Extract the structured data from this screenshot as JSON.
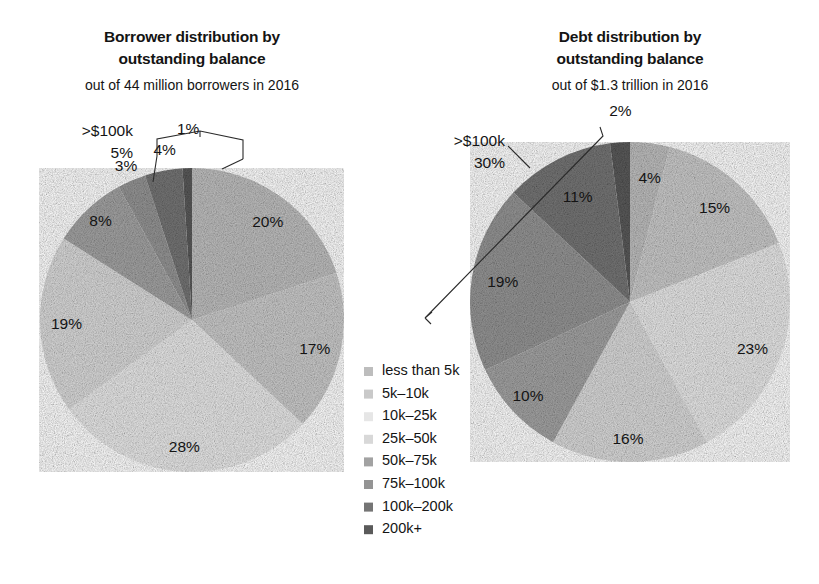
{
  "chart_data": [
    {
      "type": "pie",
      "id": "borrower-distribution",
      "title": "Borrower distribution by outstanding balance",
      "title_line1": "Borrower distribution by",
      "title_line2": "outstanding balance",
      "subtitle": "out of  44 million borrowers in 2016",
      "categories": [
        "less than 5k",
        "5k–10k",
        "10k–25k",
        "25k–50k",
        "50k–75k",
        "75k–100k",
        "100k–200k",
        "200k+"
      ],
      "values": [
        20,
        17,
        28,
        19,
        8,
        3,
        4,
        1
      ],
      "value_labels": [
        "20%",
        "17%",
        "28%",
        "19%",
        "8%",
        "3%",
        "4%",
        "1%"
      ],
      "annotation": {
        "line1": ">$100k",
        "line2": "5%"
      },
      "legend_position": "center-right (shared)",
      "grid": false
    },
    {
      "type": "pie",
      "id": "debt-distribution",
      "title": "Debt distribution by outstanding balance",
      "title_line1": "Debt distribution by",
      "title_line2": "outstanding balance",
      "subtitle": "out of $1.3 trillion in 2016",
      "categories": [
        "less than 5k",
        "5k–10k",
        "10k–25k",
        "25k–50k",
        "50k–75k",
        "75k–100k",
        "100k–200k",
        "200k+"
      ],
      "values": [
        4,
        15,
        23,
        16,
        10,
        19,
        11,
        2
      ],
      "value_labels": [
        "4%",
        "15%",
        "23%",
        "16%",
        "10%",
        "19%",
        "11%",
        "2%"
      ],
      "annotation": {
        "line1": ">$100k",
        "line2": "30%"
      },
      "legend_position": "center-left (shared)",
      "grid": false
    }
  ],
  "legend": {
    "items": [
      {
        "label": "less than 5k",
        "color": "#bdbdbd"
      },
      {
        "label": "5k–10k",
        "color": "#c9c9c9"
      },
      {
        "label": "10k–25k",
        "color": "#e6e6e6"
      },
      {
        "label": "25k–50k",
        "color": "#d8d8d8"
      },
      {
        "label": "50k–75k",
        "color": "#a2a2a2"
      },
      {
        "label": "75k–100k",
        "color": "#949494"
      },
      {
        "label": "100k–200k",
        "color": "#757575"
      },
      {
        "label": "200k+",
        "color": "#5a5a5a"
      }
    ]
  },
  "colors": {
    "text": "#141414",
    "background": "#ffffff",
    "leader_line": "#2b2b2b"
  }
}
